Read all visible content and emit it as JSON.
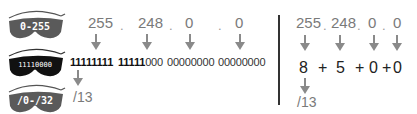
{
  "glasses": [
    {
      "label": "0-255",
      "lens_color": "#5a5a5a"
    },
    {
      "label": "11110000",
      "lens_color": "#111111"
    },
    {
      "label": "/0-/32",
      "lens_color": "#5a5a5a"
    }
  ],
  "left": {
    "octets": [
      "255",
      "248",
      "0",
      "0"
    ],
    "separator": ".",
    "binary": [
      {
        "bold": "11111111",
        "regular": ""
      },
      {
        "bold": "11111",
        "regular": "000"
      },
      {
        "bold": "",
        "regular": "00000000"
      },
      {
        "bold": "",
        "regular": "00000000"
      }
    ],
    "result": "/13"
  },
  "right": {
    "octets": [
      "255",
      "248",
      "0",
      "0"
    ],
    "separator": ".",
    "bit_counts": [
      "8",
      "5",
      "0",
      "0"
    ],
    "plus": "+",
    "result": "/13"
  },
  "colors": {
    "arrow": "#8a8a8a",
    "number_gray": "#7a7a7a",
    "divider": "#333333"
  }
}
